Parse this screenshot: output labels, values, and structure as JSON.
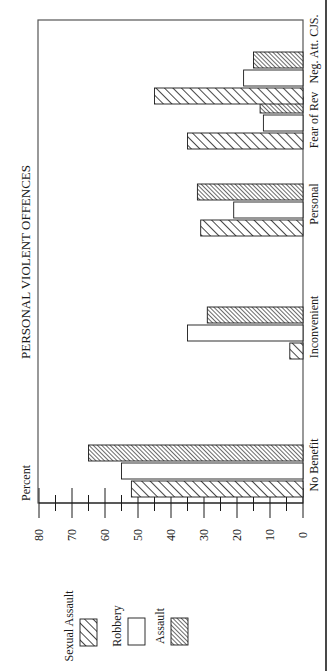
{
  "chart_data": {
    "type": "bar",
    "orientation": "rotated-90-ccw",
    "title": "PERSONAL VIOLENT OFFENCES",
    "xlabel": "",
    "ylabel": "Percent",
    "ylim": [
      0,
      80
    ],
    "yticks": [
      0,
      10,
      20,
      30,
      40,
      50,
      60,
      70,
      80
    ],
    "minor_ticks": [
      5,
      15,
      25,
      35,
      45,
      55,
      65,
      75
    ],
    "grid": false,
    "legend_position": "left (bottom of page)",
    "categories": [
      "No Benefit",
      "Inconvenient",
      "Personal",
      "Fear of Rev",
      "Neg. Att. CJS."
    ],
    "series": [
      {
        "name": "Sexual Assault",
        "pattern": "wide-diagonal-hatch",
        "values": [
          52,
          4,
          31,
          35,
          45
        ]
      },
      {
        "name": "Robbery",
        "pattern": "empty",
        "values": [
          55,
          35,
          21,
          12,
          18
        ]
      },
      {
        "name": "Assault",
        "pattern": "dense-diagonal-hatch",
        "values": [
          65,
          29,
          32,
          13,
          15
        ]
      }
    ]
  },
  "colors": {
    "ink": "#1a1a1a",
    "background": "#ffffff"
  }
}
